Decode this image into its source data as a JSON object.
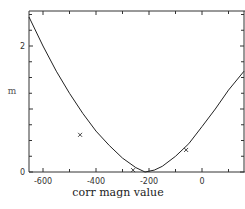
{
  "chart_data": {
    "type": "line",
    "title": "",
    "xlabel": "corr magn value",
    "ylabel": "m",
    "xlim": [
      -655,
      163
    ],
    "ylim": [
      0,
      2.55
    ],
    "x_ticks": [
      -600,
      -400,
      -200,
      0
    ],
    "x_tick_labels": [
      "-600",
      "-400",
      "-200",
      "0"
    ],
    "y_ticks": [
      0,
      2
    ],
    "y_tick_labels": [
      "0",
      "2"
    ],
    "grid": false,
    "legend": null,
    "series": [
      {
        "name": "fitted curve",
        "style": "line",
        "x": [
          -655,
          -600,
          -550,
          -500,
          -450,
          -400,
          -350,
          -300,
          -250,
          -215,
          -180,
          -150,
          -100,
          -50,
          0,
          50,
          100,
          163
        ],
        "y": [
          2.46,
          2.0,
          1.6,
          1.25,
          0.93,
          0.65,
          0.42,
          0.22,
          0.07,
          0.0,
          0.03,
          0.09,
          0.25,
          0.45,
          0.72,
          1.0,
          1.3,
          1.6
        ]
      },
      {
        "name": "data points",
        "style": "marker-x",
        "x": [
          -460,
          -260,
          -60
        ],
        "y": [
          0.59,
          0.03,
          0.35
        ]
      }
    ]
  }
}
